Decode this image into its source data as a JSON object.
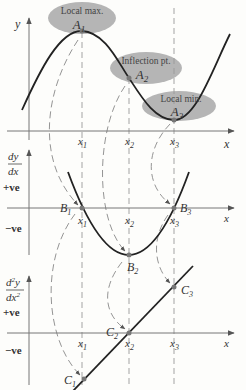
{
  "top_graph": {
    "y_label": "y",
    "x_label": "x",
    "callouts": [
      {
        "title": "Local max.",
        "point": "A",
        "sub": "1"
      },
      {
        "title": "Inflection pt.",
        "point": "A",
        "sub": "2"
      },
      {
        "title": "Local min.",
        "point": "A",
        "sub": "3"
      }
    ],
    "ticks": [
      {
        "v": "x",
        "s": "1"
      },
      {
        "v": "x",
        "s": "2"
      },
      {
        "v": "x",
        "s": "3"
      }
    ]
  },
  "first_derivative": {
    "y_label_num": "dy",
    "y_label_den": "dx",
    "x_label": "x",
    "positive": "+ve",
    "negative": "−ve",
    "points": [
      {
        "p": "B",
        "s": "1"
      },
      {
        "p": "B",
        "s": "2"
      },
      {
        "p": "B",
        "s": "3"
      }
    ],
    "ticks": [
      {
        "v": "x",
        "s": "1"
      },
      {
        "v": "x",
        "s": "2"
      },
      {
        "v": "x",
        "s": "3"
      }
    ]
  },
  "second_derivative": {
    "y_label_num": "d",
    "y_label_num_sup": "2",
    "y_label_num_var": "y",
    "y_label_den": "dx",
    "y_label_den_sup": "2",
    "x_label": "x",
    "positive": "+ve",
    "negative": "−ve",
    "points": [
      {
        "p": "C",
        "s": "1"
      },
      {
        "p": "C",
        "s": "2"
      },
      {
        "p": "C",
        "s": "3"
      }
    ],
    "ticks": [
      {
        "v": "x",
        "s": "1"
      },
      {
        "v": "x",
        "s": "2"
      },
      {
        "v": "x",
        "s": "3"
      }
    ]
  },
  "colors": {
    "curve": "#222222",
    "axis": "#777777",
    "ellipse": "#b5b5b5",
    "dash": "#888888",
    "point": "#777777"
  }
}
